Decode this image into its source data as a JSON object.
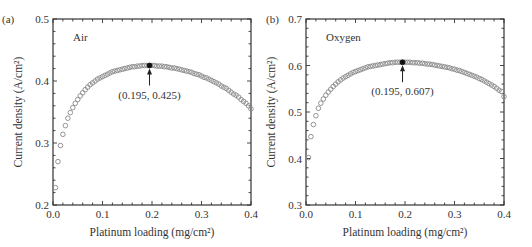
{
  "chart_data": [
    {
      "type": "scatter",
      "panel_label": "(a)",
      "annotation_label": "Air",
      "xlabel": "Platinum loading (mg/cm²)",
      "ylabel": "Current density (A/cm²)",
      "xlim": [
        0.0,
        0.4
      ],
      "ylim": [
        0.2,
        0.5
      ],
      "xticks": [
        "0.0",
        "0.1",
        "0.2",
        "0.3",
        "0.4"
      ],
      "yticks": [
        "0.2",
        "0.3",
        "0.4",
        "0.5"
      ],
      "grid": false,
      "marker": "open-circle",
      "highlight": {
        "x": 0.195,
        "y": 0.425,
        "label": "(0.195, 0.425)"
      },
      "x": [
        0.005,
        0.01,
        0.015,
        0.02,
        0.025,
        0.03,
        0.035,
        0.04,
        0.045,
        0.05,
        0.055,
        0.06,
        0.065,
        0.07,
        0.075,
        0.08,
        0.085,
        0.09,
        0.095,
        0.1,
        0.105,
        0.11,
        0.115,
        0.12,
        0.125,
        0.13,
        0.135,
        0.14,
        0.145,
        0.15,
        0.155,
        0.16,
        0.165,
        0.17,
        0.175,
        0.18,
        0.185,
        0.19,
        0.195,
        0.2,
        0.205,
        0.21,
        0.215,
        0.22,
        0.225,
        0.23,
        0.235,
        0.24,
        0.245,
        0.25,
        0.255,
        0.26,
        0.265,
        0.27,
        0.275,
        0.28,
        0.285,
        0.29,
        0.295,
        0.3,
        0.305,
        0.31,
        0.315,
        0.32,
        0.325,
        0.33,
        0.335,
        0.34,
        0.345,
        0.35,
        0.355,
        0.36,
        0.365,
        0.37,
        0.375,
        0.38,
        0.385,
        0.39,
        0.395,
        0.4
      ],
      "values": [
        0.228,
        0.27,
        0.296,
        0.314,
        0.328,
        0.34,
        0.349,
        0.357,
        0.364,
        0.37,
        0.376,
        0.381,
        0.386,
        0.39,
        0.394,
        0.397,
        0.4,
        0.403,
        0.405,
        0.407,
        0.409,
        0.411,
        0.413,
        0.415,
        0.416,
        0.417,
        0.418,
        0.419,
        0.42,
        0.421,
        0.422,
        0.423,
        0.423,
        0.424,
        0.424,
        0.425,
        0.425,
        0.425,
        0.425,
        0.425,
        0.425,
        0.424,
        0.424,
        0.424,
        0.423,
        0.423,
        0.422,
        0.421,
        0.421,
        0.42,
        0.419,
        0.418,
        0.417,
        0.416,
        0.415,
        0.414,
        0.412,
        0.411,
        0.41,
        0.408,
        0.406,
        0.405,
        0.403,
        0.401,
        0.399,
        0.397,
        0.395,
        0.392,
        0.39,
        0.388,
        0.385,
        0.382,
        0.379,
        0.377,
        0.374,
        0.37,
        0.367,
        0.364,
        0.36,
        0.355
      ]
    },
    {
      "type": "scatter",
      "panel_label": "(b)",
      "annotation_label": "Oxygen",
      "xlabel": "Platinum loading (mg/cm²)",
      "ylabel": "Current density (A/cm²)",
      "xlim": [
        0.0,
        0.4
      ],
      "ylim": [
        0.3,
        0.7
      ],
      "xticks": [
        "0.0",
        "0.1",
        "0.2",
        "0.3",
        "0.4"
      ],
      "yticks": [
        "0.3",
        "0.4",
        "0.5",
        "0.6",
        "0.7"
      ],
      "grid": false,
      "marker": "open-circle",
      "highlight": {
        "x": 0.195,
        "y": 0.607,
        "label": "(0.195, 0.607)"
      },
      "x": [
        0.005,
        0.01,
        0.015,
        0.02,
        0.025,
        0.03,
        0.035,
        0.04,
        0.045,
        0.05,
        0.055,
        0.06,
        0.065,
        0.07,
        0.075,
        0.08,
        0.085,
        0.09,
        0.095,
        0.1,
        0.105,
        0.11,
        0.115,
        0.12,
        0.125,
        0.13,
        0.135,
        0.14,
        0.145,
        0.15,
        0.155,
        0.16,
        0.165,
        0.17,
        0.175,
        0.18,
        0.185,
        0.19,
        0.195,
        0.2,
        0.205,
        0.21,
        0.215,
        0.22,
        0.225,
        0.23,
        0.235,
        0.24,
        0.245,
        0.25,
        0.255,
        0.26,
        0.265,
        0.27,
        0.275,
        0.28,
        0.285,
        0.29,
        0.295,
        0.3,
        0.305,
        0.31,
        0.315,
        0.32,
        0.325,
        0.33,
        0.335,
        0.34,
        0.345,
        0.35,
        0.355,
        0.36,
        0.365,
        0.37,
        0.375,
        0.38,
        0.385,
        0.39,
        0.395,
        0.4
      ],
      "values": [
        0.402,
        0.447,
        0.473,
        0.492,
        0.508,
        0.519,
        0.528,
        0.536,
        0.543,
        0.549,
        0.555,
        0.56,
        0.565,
        0.569,
        0.573,
        0.576,
        0.579,
        0.582,
        0.585,
        0.587,
        0.589,
        0.591,
        0.593,
        0.595,
        0.597,
        0.598,
        0.599,
        0.6,
        0.601,
        0.602,
        0.603,
        0.604,
        0.605,
        0.606,
        0.606,
        0.607,
        0.607,
        0.607,
        0.607,
        0.607,
        0.607,
        0.607,
        0.606,
        0.606,
        0.606,
        0.605,
        0.605,
        0.604,
        0.603,
        0.603,
        0.602,
        0.601,
        0.6,
        0.599,
        0.598,
        0.597,
        0.596,
        0.595,
        0.593,
        0.592,
        0.59,
        0.589,
        0.587,
        0.585,
        0.583,
        0.581,
        0.579,
        0.577,
        0.575,
        0.572,
        0.57,
        0.567,
        0.564,
        0.561,
        0.558,
        0.555,
        0.551,
        0.547,
        0.544,
        0.533
      ]
    }
  ]
}
